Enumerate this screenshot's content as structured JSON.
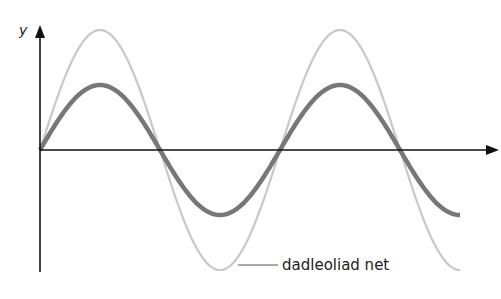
{
  "diagram": {
    "y_axis_label": "y",
    "x_axis_label": "",
    "annotation": "dadleoliad net",
    "colors": {
      "axis": "#111111",
      "light_wave": "#c8c8c8",
      "dark_wave": "#777777",
      "leader_line": "#555555"
    }
  },
  "chart_data": {
    "type": "line",
    "title": "",
    "xlabel": "",
    "ylabel": "y",
    "series": [
      {
        "name": "dadleoliad net (resultant)",
        "shape": "sine",
        "amplitude_px": 120,
        "period_px": 240,
        "color": "#c8c8c8"
      },
      {
        "name": "component wave",
        "shape": "sine",
        "amplitude_px": 65,
        "period_px": 240,
        "color": "#777777"
      }
    ],
    "axis_origin_px": [
      40,
      150
    ],
    "x_range_px": [
      40,
      460
    ],
    "zero_crossings_px": [
      40,
      160,
      280,
      400
    ],
    "grid": false,
    "legend": "annotation leader line to light wave trough"
  }
}
